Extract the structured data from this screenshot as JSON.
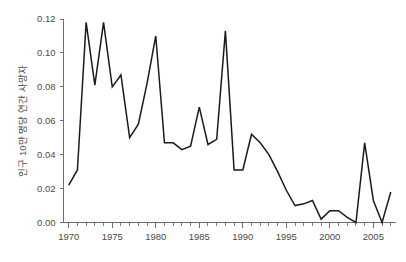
{
  "chart_data": {
    "type": "line",
    "title": "",
    "subtitle": "",
    "xlabel": "",
    "ylabel": "인구 10만 명당 연간 사망자",
    "xlim": [
      1969.4,
      2007.6
    ],
    "ylim": [
      0.0,
      0.12
    ],
    "grid": false,
    "legend": null,
    "legend_position": "none",
    "x_tick_labels": [
      "1970",
      "1975",
      "1980",
      "1985",
      "1990",
      "1995",
      "2000",
      "2005"
    ],
    "x_tick_values": [
      1970,
      1975,
      1980,
      1985,
      1990,
      1995,
      2000,
      2005
    ],
    "x_minor_tick_interval": 1,
    "y_tick_labels": [
      "0.00",
      "0.02",
      "0.04",
      "0.06",
      "0.08",
      "0.10",
      "0.12"
    ],
    "y_tick_values": [
      0.0,
      0.02,
      0.04,
      0.06,
      0.08,
      0.1,
      0.12
    ],
    "series": [
      {
        "name": "연간 사망자",
        "color": "#1a1a1a",
        "x": [
          1970,
          1971,
          1972,
          1973,
          1974,
          1975,
          1976,
          1977,
          1978,
          1979,
          1980,
          1981,
          1982,
          1983,
          1984,
          1985,
          1986,
          1987,
          1988,
          1989,
          1990,
          1991,
          1992,
          1993,
          1994,
          1995,
          1996,
          1997,
          1998,
          1999,
          2000,
          2001,
          2002,
          2003,
          2004,
          2005,
          2006,
          2007
        ],
        "values": [
          0.022,
          0.031,
          0.118,
          0.081,
          0.118,
          0.08,
          0.087,
          0.05,
          0.058,
          0.082,
          0.11,
          0.047,
          0.047,
          0.043,
          0.045,
          0.068,
          0.046,
          0.049,
          0.113,
          0.031,
          0.031,
          0.052,
          0.047,
          0.04,
          0.03,
          0.019,
          0.01,
          0.011,
          0.013,
          0.002,
          0.007,
          0.007,
          0.003,
          0.0,
          0.047,
          0.013,
          0.0,
          0.018
        ]
      }
    ],
    "annotations": []
  },
  "axis": {
    "y_title": "인구 10만 명당 연간 사망자"
  }
}
